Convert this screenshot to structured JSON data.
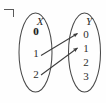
{
  "figure": {
    "kind": "function-mapping-diagram",
    "corner_mark": "¬",
    "stroke_color": "#4a4a4a",
    "text_color": "#2d2d2d",
    "highlight_color": "#1a1a1a",
    "background": "#fefefe",
    "domain_set": {
      "label": "X",
      "ellipse": {
        "cx": 35.5,
        "cy": 52.5,
        "rx": 16.5,
        "ry": 39.5
      },
      "label_pos": {
        "x": 30,
        "y": 16
      },
      "elements": [
        {
          "value": "0",
          "x": 28,
          "y": 26,
          "highlighted": true
        },
        {
          "value": "1",
          "x": 28,
          "y": 48,
          "highlighted": false
        },
        {
          "value": "2",
          "x": 28,
          "y": 69,
          "highlighted": false
        }
      ]
    },
    "codomain_set": {
      "label": "Y",
      "ellipse": {
        "cx": 84.5,
        "cy": 52.5,
        "rx": 16.0,
        "ry": 39.5
      },
      "label_pos": {
        "x": 79,
        "y": 16
      },
      "elements": [
        {
          "value": "0",
          "x": 78,
          "y": 29,
          "highlighted": false
        },
        {
          "value": "1",
          "x": 78,
          "y": 43,
          "highlighted": false
        },
        {
          "value": "2",
          "x": 78,
          "y": 57,
          "highlighted": false
        },
        {
          "value": "3",
          "x": 78,
          "y": 71,
          "highlighted": false
        }
      ]
    },
    "arrows": [
      {
        "from": "1",
        "to": "0",
        "x1": 41,
        "y1": 55.5,
        "x2": 77.5,
        "y2": 33.5
      },
      {
        "from": "2",
        "to": "1",
        "x1": 41,
        "y1": 75.0,
        "x2": 77.5,
        "y2": 48.0
      }
    ]
  }
}
